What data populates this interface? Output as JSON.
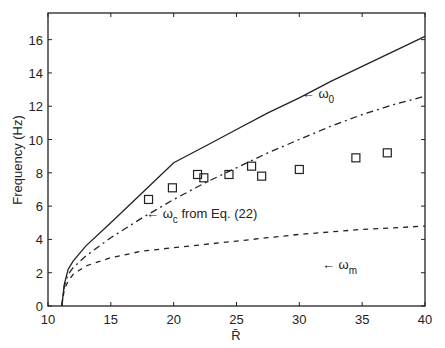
{
  "chart_data": {
    "type": "line",
    "title": "",
    "xlabel": "R̄",
    "ylabel": "Frequency (Hz)",
    "xlim": [
      10,
      40
    ],
    "ylim": [
      0,
      17.6
    ],
    "xticks": [
      10,
      15,
      20,
      25,
      30,
      35,
      40
    ],
    "yticks": [
      0,
      2,
      4,
      6,
      8,
      10,
      12,
      14,
      16
    ],
    "grid": false,
    "legend": "none (inline annotations)",
    "series": [
      {
        "name": "ω0",
        "style": "solid",
        "x": [
          11.1,
          11.3,
          11.6,
          12,
          13,
          15,
          17.5,
          20,
          22.5,
          25,
          27.5,
          30,
          32.5,
          35,
          37.5,
          40
        ],
        "y": [
          0,
          1.3,
          2.2,
          2.7,
          3.6,
          5.0,
          6.8,
          8.6,
          9.6,
          10.6,
          11.6,
          12.5,
          13.5,
          14.4,
          15.3,
          16.2
        ]
      },
      {
        "name": "ωc from Eq. (22)",
        "style": "dash-dot",
        "x": [
          11.1,
          11.3,
          11.6,
          12,
          13,
          15,
          17.5,
          20,
          22.5,
          25,
          27.5,
          30,
          32.5,
          35,
          37.5,
          40
        ],
        "y": [
          0,
          1.2,
          1.9,
          2.3,
          3.0,
          4.1,
          5.3,
          6.4,
          7.4,
          8.3,
          9.2,
          10.0,
          10.8,
          11.5,
          12.1,
          12.6
        ]
      },
      {
        "name": "ωm",
        "style": "dashed",
        "x": [
          11.1,
          11.3,
          11.6,
          12,
          13,
          15,
          17.5,
          20,
          22.5,
          25,
          27.5,
          30,
          32.5,
          35,
          37.5,
          40
        ],
        "y": [
          0,
          1.0,
          1.5,
          1.9,
          2.4,
          2.9,
          3.3,
          3.5,
          3.7,
          3.9,
          4.1,
          4.3,
          4.45,
          4.6,
          4.7,
          4.8
        ]
      },
      {
        "name": "measured",
        "style": "open-square markers",
        "x": [
          18.0,
          19.9,
          21.9,
          22.4,
          24.4,
          26.2,
          27.0,
          30.0,
          34.5,
          37.0
        ],
        "y": [
          6.4,
          7.1,
          7.9,
          7.7,
          7.9,
          8.4,
          7.8,
          8.2,
          8.9,
          9.2
        ]
      }
    ],
    "annotations": [
      {
        "text": "← ω",
        "sub": "0",
        "x": 30.2,
        "y": 12.5
      },
      {
        "text": "← ω",
        "sub": "c",
        "suffix": " from Eq.  (22)",
        "x": 17.8,
        "y": 5.3
      },
      {
        "text": "← ω",
        "sub": "m",
        "suffix": "",
        "x": 31.8,
        "y": 2.2
      }
    ]
  }
}
